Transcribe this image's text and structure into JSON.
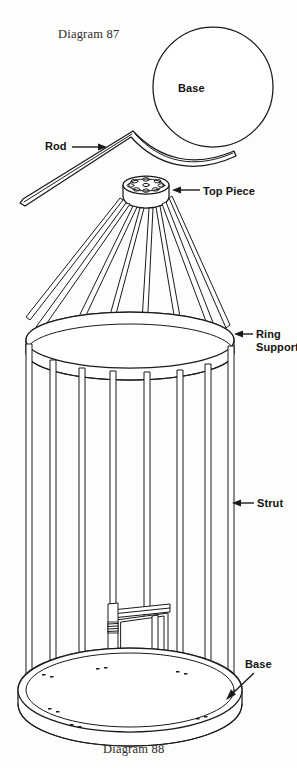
{
  "figure": {
    "top_caption": "Diagram 87",
    "bottom_caption": "Diagram 88",
    "background_color": "#fdfdfc",
    "line_color": "#1a1a1a"
  },
  "labels": {
    "base_top": "Base",
    "rod": "Rod",
    "top_piece": "Top Piece",
    "ring_support": "Ring\nSupport",
    "strut": "Strut",
    "base_bottom": "Base"
  },
  "parts": [
    {
      "name": "Base",
      "diagram": "Diagram 87",
      "shape": "circular disc"
    },
    {
      "name": "Rod",
      "diagram": "Diagram 87",
      "shape": "bent rod"
    },
    {
      "name": "Top Piece",
      "diagram": "Diagram 88",
      "shape": "perforated hub disc"
    },
    {
      "name": "Ring Support",
      "diagram": "Diagram 88",
      "shape": "horizontal ring"
    },
    {
      "name": "Strut",
      "diagram": "Diagram 88",
      "shape": "vertical rod"
    },
    {
      "name": "Base",
      "diagram": "Diagram 88",
      "shape": "circular platform"
    }
  ]
}
